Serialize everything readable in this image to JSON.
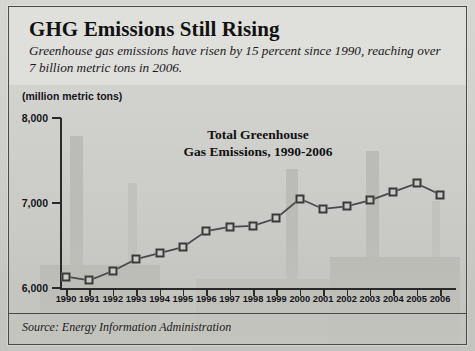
{
  "header": {
    "title": "GHG Emissions Still Rising",
    "subtitle": "Greenhouse gas emissions have risen by 15 percent since 1990, reaching over 7 billion metric tons in 2006."
  },
  "footer": {
    "source": "Source: Energy Information Administration"
  },
  "chart_data": {
    "type": "line",
    "title": "Total Greenhouse\nGas Emissions, 1990-2006",
    "title_line1": "Total Greenhouse",
    "title_line2": "Gas Emissions, 1990-2006",
    "unit_label": "(million metric tons)",
    "xlabel": "",
    "ylabel": "million metric tons",
    "ylim": [
      6000,
      8000
    ],
    "yticks": [
      6000,
      7000,
      8000
    ],
    "ytick_labels": [
      "6,000",
      "7,000",
      "8,000"
    ],
    "grid": false,
    "legend": "none",
    "marker": "square",
    "categories": [
      1990,
      1991,
      1992,
      1993,
      1994,
      1995,
      1996,
      1997,
      1998,
      1999,
      2000,
      2001,
      2002,
      2003,
      2004,
      2005,
      2006
    ],
    "tick_labels": [
      "1990",
      "1991",
      "1992",
      "1993",
      "1994",
      "1995",
      "1996",
      "1997",
      "1998",
      "1999",
      "2000",
      "2001",
      "2002",
      "2003",
      "2004",
      "2005",
      "2006"
    ],
    "values": [
      6135,
      6090,
      6200,
      6340,
      6410,
      6480,
      6670,
      6720,
      6730,
      6820,
      7050,
      6930,
      6960,
      7030,
      7130,
      7230,
      7100
    ],
    "series": [
      {
        "name": "Total Greenhouse Gas Emissions",
        "values": [
          6135,
          6090,
          6200,
          6340,
          6410,
          6480,
          6670,
          6720,
          6730,
          6820,
          7050,
          6930,
          6960,
          7030,
          7130,
          7230,
          7100
        ]
      }
    ],
    "colors": {
      "line": "#4a4a4a",
      "marker_fill": "#c9c9c5",
      "marker_edge": "#3a3a3a",
      "axis": "#2a2a2a"
    }
  }
}
